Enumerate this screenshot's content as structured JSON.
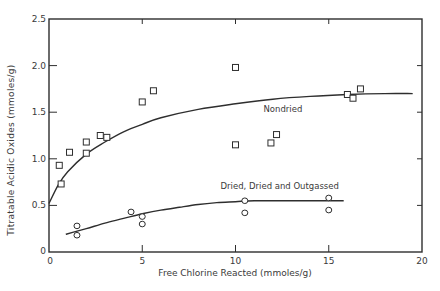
{
  "chart_data": {
    "type": "scatter",
    "title": "",
    "xlabel": "Free Chlorine Reacted  (mmoles/g)",
    "ylabel": "Titratable Acidic Oxides  (mmoles/g)",
    "xlim": [
      0,
      20
    ],
    "ylim": [
      0,
      2.5
    ],
    "x_ticks": [
      0,
      5,
      10,
      15,
      20
    ],
    "x_tick_labels": [
      "0",
      "5",
      "10",
      "15",
      "20"
    ],
    "y_ticks": [
      0,
      0.5,
      1.0,
      1.5,
      2.0,
      2.5
    ],
    "y_tick_labels": [
      "0",
      "0.5",
      "1.0",
      "1.5",
      "2.0",
      "2.5"
    ],
    "grid": false,
    "legend": "none (curves labeled directly)",
    "series": [
      {
        "name": "Nondried",
        "marker": "square",
        "label_position": {
          "x": 11.5,
          "y": 1.5
        },
        "points": [
          {
            "x": 0.55,
            "y": 0.93
          },
          {
            "x": 0.65,
            "y": 0.73
          },
          {
            "x": 1.1,
            "y": 1.07
          },
          {
            "x": 2.0,
            "y": 1.06
          },
          {
            "x": 2.0,
            "y": 1.18
          },
          {
            "x": 2.75,
            "y": 1.25
          },
          {
            "x": 3.1,
            "y": 1.23
          },
          {
            "x": 5.0,
            "y": 1.61
          },
          {
            "x": 5.6,
            "y": 1.73
          },
          {
            "x": 10.0,
            "y": 1.98
          },
          {
            "x": 10.0,
            "y": 1.15
          },
          {
            "x": 11.9,
            "y": 1.17
          },
          {
            "x": 12.2,
            "y": 1.26
          },
          {
            "x": 16.0,
            "y": 1.69
          },
          {
            "x": 16.3,
            "y": 1.65
          },
          {
            "x": 16.7,
            "y": 1.75
          }
        ],
        "fit_curve": [
          {
            "x": 0,
            "y": 0.52
          },
          {
            "x": 0.5,
            "y": 0.72
          },
          {
            "x": 1,
            "y": 0.86
          },
          {
            "x": 2,
            "y": 1.05
          },
          {
            "x": 3,
            "y": 1.18
          },
          {
            "x": 4,
            "y": 1.29
          },
          {
            "x": 5,
            "y": 1.37
          },
          {
            "x": 6,
            "y": 1.44
          },
          {
            "x": 8,
            "y": 1.53
          },
          {
            "x": 10,
            "y": 1.59
          },
          {
            "x": 12,
            "y": 1.64
          },
          {
            "x": 14,
            "y": 1.67
          },
          {
            "x": 16,
            "y": 1.69
          },
          {
            "x": 18,
            "y": 1.7
          },
          {
            "x": 19.5,
            "y": 1.7
          }
        ]
      },
      {
        "name": "Dried, Dried and Outgassed",
        "marker": "circle",
        "label_position": {
          "x": 9.2,
          "y": 0.68
        },
        "points": [
          {
            "x": 1.5,
            "y": 0.28
          },
          {
            "x": 1.5,
            "y": 0.18
          },
          {
            "x": 4.4,
            "y": 0.43
          },
          {
            "x": 5.0,
            "y": 0.38
          },
          {
            "x": 5.0,
            "y": 0.3
          },
          {
            "x": 10.5,
            "y": 0.55
          },
          {
            "x": 10.5,
            "y": 0.42
          },
          {
            "x": 15.0,
            "y": 0.58
          },
          {
            "x": 15.0,
            "y": 0.45
          }
        ],
        "fit_curve": [
          {
            "x": 0.9,
            "y": 0.19
          },
          {
            "x": 2,
            "y": 0.25
          },
          {
            "x": 3,
            "y": 0.31
          },
          {
            "x": 4,
            "y": 0.36
          },
          {
            "x": 5,
            "y": 0.41
          },
          {
            "x": 6,
            "y": 0.45
          },
          {
            "x": 7,
            "y": 0.48
          },
          {
            "x": 8,
            "y": 0.51
          },
          {
            "x": 9,
            "y": 0.53
          },
          {
            "x": 10,
            "y": 0.54
          },
          {
            "x": 11,
            "y": 0.55
          },
          {
            "x": 13,
            "y": 0.55
          },
          {
            "x": 15.8,
            "y": 0.55
          }
        ]
      }
    ],
    "annotations": [
      "Nondried",
      "Dried, Dried and Outgassed"
    ]
  },
  "colors": {
    "ink": "#2e2e2e",
    "background": "#ffffff"
  }
}
